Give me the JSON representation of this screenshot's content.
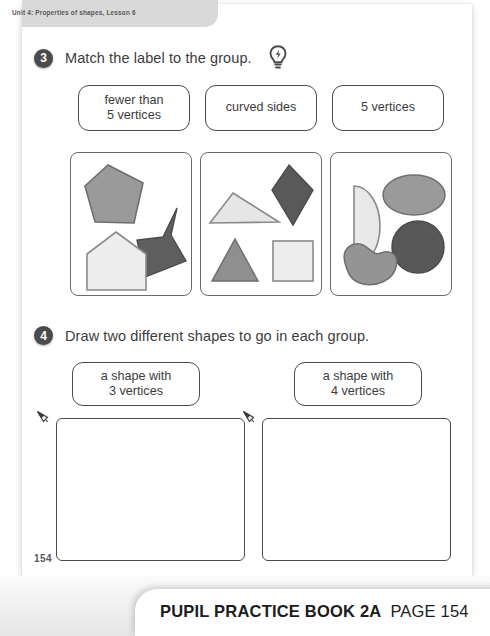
{
  "header": {
    "running_head": "Unit 4: Properties of shapes, Lesson 6"
  },
  "questions": [
    {
      "number": "3",
      "prompt": "Match the label to the group.",
      "hint_icon": "lightbulb-icon",
      "labels": [
        {
          "line1": "fewer than",
          "line2": "5 vertices"
        },
        {
          "line1": "curved sides",
          "line2": ""
        },
        {
          "line1": "5 vertices",
          "line2": ""
        }
      ],
      "groups": [
        {
          "name": "group-box-1",
          "shapes": [
            {
              "name": "pentagon",
              "fill": "#9a9a9a"
            },
            {
              "name": "concave-arrow-pentagon",
              "fill": "#5e5e5e"
            },
            {
              "name": "house-pentagon",
              "fill": "#ededed"
            }
          ]
        },
        {
          "name": "group-box-2",
          "shapes": [
            {
              "name": "triangle-light",
              "fill": "#e6e6e6"
            },
            {
              "name": "kite-dark",
              "fill": "#595959"
            },
            {
              "name": "triangle-gray",
              "fill": "#8f8f8f"
            },
            {
              "name": "square-light",
              "fill": "#ededed"
            }
          ]
        },
        {
          "name": "group-box-3",
          "shapes": [
            {
              "name": "semicircle-light",
              "fill": "#e8e8e8"
            },
            {
              "name": "ellipse-gray",
              "fill": "#9a9a9a"
            },
            {
              "name": "circle-dark",
              "fill": "#585858"
            },
            {
              "name": "bean-gray",
              "fill": "#949494"
            }
          ]
        }
      ]
    },
    {
      "number": "4",
      "prompt": "Draw two different shapes to go in each group.",
      "labels": [
        {
          "line1": "a shape with",
          "line2": "3 vertices"
        },
        {
          "line1": "a shape with",
          "line2": "4 vertices"
        }
      ],
      "answer_boxes": [
        {
          "name": "drawing-area-left",
          "icon": "pencil-icon"
        },
        {
          "name": "drawing-area-right",
          "icon": "pencil-icon"
        }
      ]
    }
  ],
  "page_number": "154",
  "footer": {
    "book_title": "PUPIL PRACTICE BOOK 2A",
    "page_label": "PAGE 154"
  },
  "colors": {
    "ink": "#3c3c3c",
    "rule": "#4a4a4a",
    "tab_bg": "#d9d9d9",
    "bullet_bg": "#4b4b4b"
  }
}
